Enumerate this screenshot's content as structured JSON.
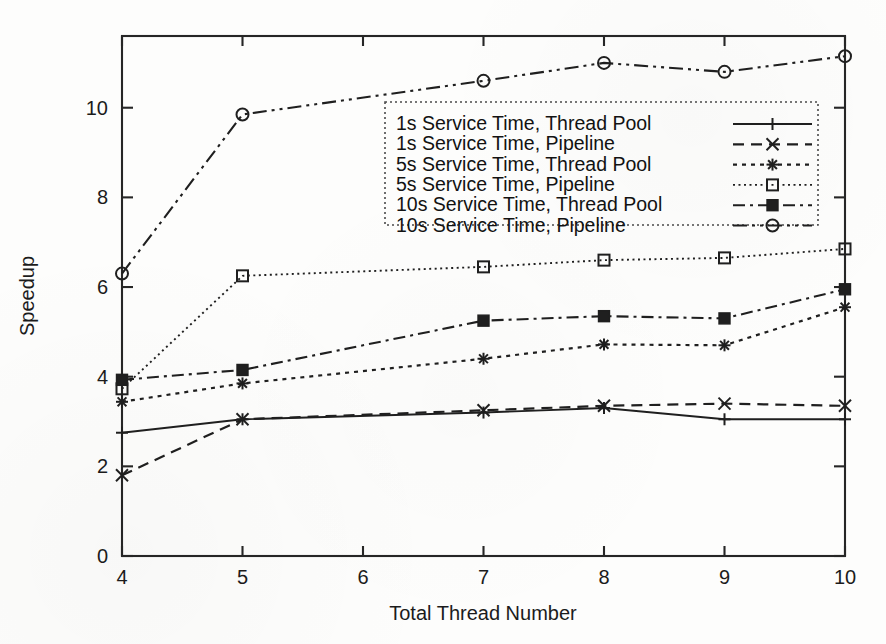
{
  "chart_data": {
    "type": "line",
    "title": "",
    "xlabel": "Total Thread Number",
    "ylabel": "Speedup",
    "x": [
      4,
      5,
      7,
      8,
      9,
      10
    ],
    "xlim": [
      4,
      10
    ],
    "ylim": [
      0,
      11.6
    ],
    "xticks": [
      "4",
      "5",
      "6",
      "7",
      "8",
      "9",
      "10"
    ],
    "yticks": [
      "0",
      "2",
      "4",
      "6",
      "8",
      "10"
    ],
    "grid": false,
    "legend_position": "upper center",
    "series": [
      {
        "name": "1s Service Time, Thread Pool",
        "marker": "plus",
        "dash": "none",
        "values": [
          2.75,
          3.05,
          3.2,
          3.3,
          3.05,
          3.05
        ]
      },
      {
        "name": "1s Service Time, Pipeline",
        "marker": "cross",
        "dash": "dashed",
        "values": [
          1.8,
          3.05,
          3.25,
          3.35,
          3.4,
          3.35
        ]
      },
      {
        "name": "5s Service Time, Thread Pool",
        "marker": "asterisk",
        "dash": "dotted",
        "values": [
          3.44,
          3.85,
          4.4,
          4.72,
          4.7,
          5.55
        ]
      },
      {
        "name": "5s Service Time, Pipeline",
        "marker": "open-square",
        "dash": "fine-dotted",
        "values": [
          3.73,
          6.25,
          6.45,
          6.6,
          6.65,
          6.85
        ]
      },
      {
        "name": "10s Service Time, Thread Pool",
        "marker": "filled-square",
        "dash": "dash-dot",
        "values": [
          3.93,
          4.15,
          5.25,
          5.35,
          5.3,
          5.95
        ]
      },
      {
        "name": "10s Service Time, Pipeline",
        "marker": "open-circle",
        "dash": "dash-dot-long",
        "values": [
          6.3,
          9.85,
          10.6,
          11.0,
          10.8,
          11.15
        ]
      }
    ]
  },
  "axis": {
    "x_title": "Total Thread Number",
    "y_title": "Speedup"
  }
}
